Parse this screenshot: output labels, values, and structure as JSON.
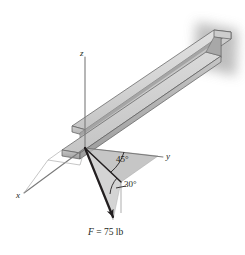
{
  "figure": {
    "type": "engineering-statics-free-body-diagram",
    "background_color": "#ffffff"
  },
  "axes": {
    "z": {
      "label": "z",
      "description": "vertical axis pointing up"
    },
    "y": {
      "label": "y",
      "description": "axis pointing to the right"
    },
    "x": {
      "label": "x",
      "description": "axis pointing toward lower-left"
    },
    "origin_label": ""
  },
  "angles": [
    {
      "name": "azimuth-angle",
      "label": "45°",
      "value": 45,
      "unit": "degrees",
      "measured_from": "y-axis"
    },
    {
      "name": "elevation-angle",
      "label": "30°",
      "value": 30,
      "unit": "degrees",
      "measured_from": "horizontal-xy-plane"
    }
  ],
  "force": {
    "symbol": "F",
    "equals": " = ",
    "magnitude": "75",
    "unit": "lb",
    "full_label": "F = 75 lb",
    "direction": "below the xy-plane, toward lower-right"
  },
  "colors": {
    "line": "#231f20",
    "axis": "#6e6e6e",
    "beam_top_face": "#d9d9d9",
    "beam_side_face": "#b4b4b4",
    "beam_web_face": "#cfcfcf",
    "beam_edge": "#5a5a5a",
    "plane_fill": "#b9b9b9",
    "plane_fill_light": "#c9c9c9",
    "shadow": "#b0b0b0"
  },
  "beam": {
    "name": "wide-flange-i-beam",
    "description": "I-beam extending from lower-left origin up to the right"
  }
}
